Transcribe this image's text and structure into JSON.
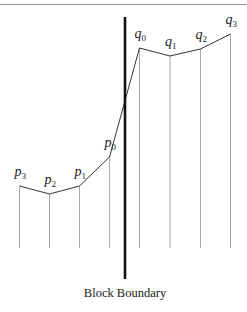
{
  "diagram": {
    "caption": "Block Boundary",
    "colors": {
      "top_rule": "#9a9a9a",
      "sample_bar": "#a8a8a8",
      "polyline": "#333333",
      "boundary": "#111111",
      "text": "#1a1a1a"
    },
    "samples": [
      {
        "name": "p",
        "index": "3",
        "x": 19.5,
        "y": 186
      },
      {
        "name": "p",
        "index": "2",
        "x": 49.5,
        "y": 194
      },
      {
        "name": "p",
        "index": "1",
        "x": 79.5,
        "y": 186
      },
      {
        "name": "p",
        "index": "0",
        "x": 109.5,
        "y": 157
      },
      {
        "name": "q",
        "index": "0",
        "x": 139.5,
        "y": 48
      },
      {
        "name": "q",
        "index": "1",
        "x": 170,
        "y": 56
      },
      {
        "name": "q",
        "index": "2",
        "x": 200.5,
        "y": 49
      },
      {
        "name": "q",
        "index": "3",
        "x": 230.5,
        "y": 34
      }
    ],
    "baseline_y": 248,
    "boundary": {
      "x": 125,
      "y1": 17,
      "y2": 279
    }
  }
}
